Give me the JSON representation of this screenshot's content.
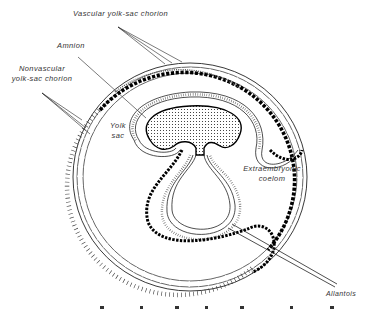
{
  "figure": {
    "type": "embryology-cross-section",
    "background": "#ffffff",
    "ink_color": "#111111",
    "labels": {
      "vascular_yolk_sac_chorion": "Vascular yolk-sac chorion",
      "amnion": "Amnion",
      "nonvascular_line1": "Nonvascular",
      "nonvascular_line2": "yolk-sac chorion",
      "yolk_line1": "Yolk",
      "yolk_line2": "sac",
      "coelom_line1": "Extraembryonic",
      "coelom_line2": "coelom",
      "allantois": "Allantois"
    },
    "structures": [
      "outer-chorion-ring",
      "vascular-band",
      "nonvascular-band",
      "amniotic-fold",
      "embryo-body",
      "yolk-stalk",
      "allantois-sac",
      "extraembryonic-coelom"
    ]
  }
}
